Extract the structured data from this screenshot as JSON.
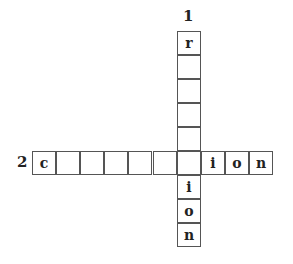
{
  "puzzle": {
    "clue_numbers": {
      "down": "1",
      "across": "2"
    },
    "down_word": {
      "number": "1",
      "cells": [
        "r",
        "",
        "",
        "",
        "",
        "",
        "i",
        "o",
        "n"
      ]
    },
    "across_word": {
      "number": "2",
      "cells": [
        "c",
        "",
        "",
        "",
        "",
        "",
        "",
        "i",
        "o",
        "n"
      ]
    },
    "intersection": {
      "down_index": 5,
      "across_index": 6
    }
  }
}
